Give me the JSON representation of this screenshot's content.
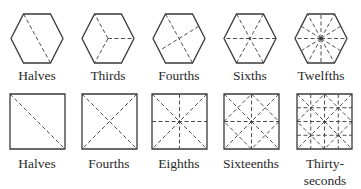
{
  "diagram": {
    "stroke_color": "#3a3a3a",
    "background": "#ffffff",
    "rows": [
      {
        "shape": "hexagon",
        "items": [
          {
            "label": "Halves",
            "divisions": 2,
            "cx": 37
          },
          {
            "label": "Thirds",
            "divisions": 3,
            "cx": 108
          },
          {
            "label": "Fourths",
            "divisions": 4,
            "cx": 179
          },
          {
            "label": "Sixths",
            "divisions": 6,
            "cx": 250
          },
          {
            "label": "Twelfths",
            "divisions": 12,
            "cx": 321
          }
        ]
      },
      {
        "shape": "square",
        "items": [
          {
            "label": "Halves",
            "divisions": 2,
            "x": 10
          },
          {
            "label": "Fourths",
            "divisions": 4,
            "x": 82
          },
          {
            "label": "Eighths",
            "divisions": 8,
            "x": 152
          },
          {
            "label": "Sixteenths",
            "divisions": 16,
            "x": 224
          },
          {
            "label": "Thirty-",
            "label2": "seconds",
            "divisions": 32,
            "x": 297
          }
        ]
      }
    ]
  }
}
